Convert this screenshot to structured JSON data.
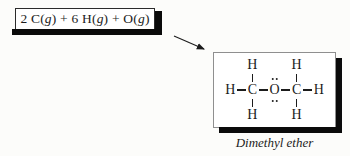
{
  "equation_box": {
    "plain": "2 C(g) + 6 H(g) + O(g)",
    "segments": [
      {
        "text": "2 C(",
        "italic": false
      },
      {
        "text": "g",
        "italic": true
      },
      {
        "text": ") + 6 H(",
        "italic": false
      },
      {
        "text": "g",
        "italic": true
      },
      {
        "text": ") + O(",
        "italic": false
      },
      {
        "text": "g",
        "italic": true
      },
      {
        "text": ")",
        "italic": false
      }
    ]
  },
  "molecule": {
    "caption": "Dimethyl ether",
    "atoms": {
      "hydrogen": "H",
      "carbon": "C",
      "oxygen": "O"
    },
    "lone_pairs": {
      "above_oxygen": 2,
      "below_oxygen": 2
    }
  },
  "colors": {
    "background": "#fcfcfa",
    "text": "#1c1c1c",
    "shadow": "#0a0a0a",
    "box_border": "#2b2b2b",
    "panel_border": "#8f8f8f"
  }
}
